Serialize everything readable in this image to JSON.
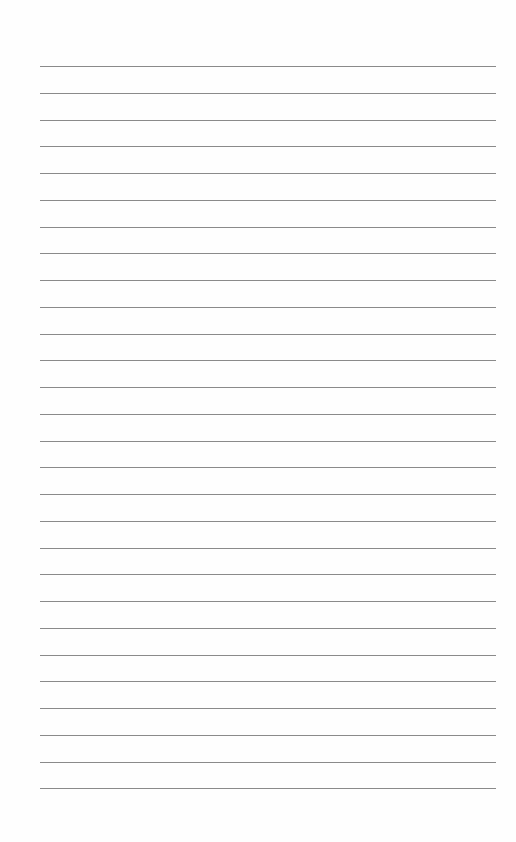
{
  "page": {
    "type": "lined-paper",
    "line_count": 28,
    "first_line_y": 66,
    "line_spacing": 26.75,
    "line_left": 40,
    "line_width": 456,
    "line_color": "#8a8a8a",
    "background": "#fefefe"
  }
}
